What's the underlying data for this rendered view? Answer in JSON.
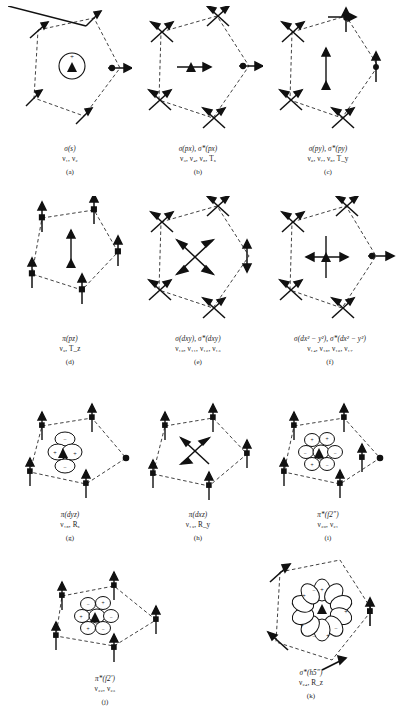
{
  "figure": {
    "kind": "molecular-orbital-symmetry-diagrams",
    "panel_count": 11,
    "ink_color": "#111111",
    "background_color": "#ffffff"
  },
  "panels": [
    {
      "id": "a",
      "letter": "(a)",
      "orbital_label": "σ(s)",
      "modes_label": "ν₁, ν₂",
      "center_type": "s-circle",
      "center_signs": [
        "+"
      ],
      "vertex_arrows": "radial-in-plane",
      "row": 0,
      "col": 0
    },
    {
      "id": "b",
      "letter": "(b)",
      "orbital_label": "σ(px), σ*(px)",
      "modes_label": "ν₃, ν₄, ν₅, Tₓ",
      "center_type": "px-arrow-horizontal",
      "center_signs": [],
      "vertex_arrows": "crossed",
      "row": 0,
      "col": 1
    },
    {
      "id": "c",
      "letter": "(c)",
      "orbital_label": "σ(py), σ*(py)",
      "modes_label": "ν₆, ν₇, ν₈, T_y",
      "center_type": "py-arrow-vertical",
      "center_signs": [],
      "vertex_arrows": "crossed",
      "row": 0,
      "col": 2
    },
    {
      "id": "d",
      "letter": "(d)",
      "orbital_label": "π(pz)",
      "modes_label": "ν₉, T_z",
      "center_type": "pz-arrow-up",
      "center_signs": [],
      "vertex_arrows": "vertical",
      "row": 1,
      "col": 0
    },
    {
      "id": "e",
      "letter": "(e)",
      "orbital_label": "σ(dxy), σ*(dxy)",
      "modes_label": "ν₁₀, ν₁₁, ν₁₂, ν₁₃",
      "center_type": "dxy-cross-diagonal",
      "center_signs": [],
      "vertex_arrows": "crossed",
      "row": 1,
      "col": 1
    },
    {
      "id": "f",
      "letter": "(f)",
      "orbital_label": "σ(dx² − y²), σ*(dx² − y²)",
      "modes_label": "ν₁₄, ν₁₅, ν₁₆, ν₁₇",
      "center_type": "dx2y2-cross-upright",
      "center_signs": [],
      "vertex_arrows": "crossed",
      "row": 1,
      "col": 2
    },
    {
      "id": "g",
      "letter": "(g)",
      "orbital_label": "π(dyz)",
      "modes_label": "ν₁₈, Rₓ",
      "center_type": "dyz-lobes",
      "center_signs": [
        "−",
        "+",
        "+",
        "−"
      ],
      "vertex_arrows": "vertical",
      "row": 2,
      "col": 0
    },
    {
      "id": "h",
      "letter": "(h)",
      "orbital_label": "π(dxz)",
      "modes_label": "ν₁₉, R_y",
      "center_type": "dxz-cross",
      "center_signs": [],
      "vertex_arrows": "vertical",
      "row": 2,
      "col": 1
    },
    {
      "id": "i",
      "letter": "(i)",
      "orbital_label": "π*(f2″)",
      "modes_label": "ν₂₀, ν₂₁",
      "center_type": "f-four-lobe-cluster",
      "center_signs": [
        "+",
        "+",
        "−",
        "−",
        "+",
        "−"
      ],
      "vertex_arrows": "vertical",
      "row": 2,
      "col": 2
    },
    {
      "id": "j",
      "letter": "(j)",
      "orbital_label": "π*(f2′)",
      "modes_label": "ν₂₂, ν₂₃",
      "center_type": "f-four-lobe-cluster",
      "center_signs": [
        "−",
        "+",
        "+",
        "−",
        "+",
        "−"
      ],
      "vertex_arrows": "vertical",
      "row": 3,
      "col": 0
    },
    {
      "id": "k",
      "letter": "(k)",
      "orbital_label": "σ*(h5″)",
      "modes_label": "ν₂₄, R_z",
      "center_type": "h-ten-lobe-rosette",
      "center_signs": [
        "+",
        "−",
        "+",
        "−",
        "+",
        "−",
        "+",
        "−",
        "+",
        "−"
      ],
      "vertex_arrows": "tangential",
      "row": 3,
      "col": 2
    }
  ]
}
